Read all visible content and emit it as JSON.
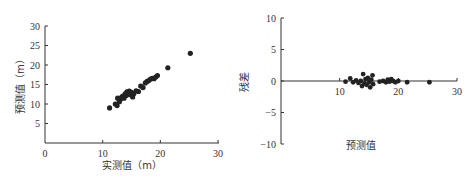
{
  "chart_data": [
    {
      "type": "scatter",
      "title": "",
      "xlabel": "实测值（m）",
      "ylabel": "预测值（m）",
      "xlim": [
        0,
        30
      ],
      "ylim": [
        0,
        30
      ],
      "xticks": [
        "0",
        "10",
        "20",
        "30"
      ],
      "yticks": [
        "5",
        "10",
        "15",
        "20",
        "25",
        "30"
      ],
      "grid": false,
      "legend": null,
      "color": "#222222",
      "points": [
        [
          11.2,
          9.0
        ],
        [
          12.2,
          10.0
        ],
        [
          12.5,
          9.6
        ],
        [
          12.6,
          11.5
        ],
        [
          12.9,
          10.6
        ],
        [
          13.1,
          11.2
        ],
        [
          13.3,
          11.8
        ],
        [
          13.5,
          12.0
        ],
        [
          13.7,
          11.5
        ],
        [
          13.9,
          12.6
        ],
        [
          14.1,
          12.2
        ],
        [
          14.2,
          13.1
        ],
        [
          14.4,
          12.7
        ],
        [
          14.6,
          13.3
        ],
        [
          14.8,
          12.4
        ],
        [
          15.0,
          13.0
        ],
        [
          15.2,
          11.8
        ],
        [
          15.4,
          12.6
        ],
        [
          15.8,
          13.4
        ],
        [
          16.2,
          13.2
        ],
        [
          16.6,
          14.6
        ],
        [
          17.0,
          14.2
        ],
        [
          17.4,
          15.4
        ],
        [
          17.7,
          15.8
        ],
        [
          18.0,
          16.0
        ],
        [
          18.3,
          16.4
        ],
        [
          18.6,
          16.6
        ],
        [
          18.9,
          16.5
        ],
        [
          19.2,
          16.9
        ],
        [
          19.5,
          17.3
        ],
        [
          21.3,
          19.3
        ],
        [
          25.2,
          23.0
        ]
      ]
    },
    {
      "type": "scatter",
      "title": "",
      "xlabel": "预测值",
      "ylabel": "残差",
      "xlim": [
        0,
        30
      ],
      "ylim": [
        -10,
        10
      ],
      "xticks": [
        "10",
        "20",
        "30"
      ],
      "yticks": [
        "10",
        "5",
        "0",
        "−5",
        "−10"
      ],
      "grid": false,
      "legend": null,
      "color": "#222222",
      "points": [
        [
          11.0,
          -0.1
        ],
        [
          11.8,
          0.4
        ],
        [
          12.3,
          -0.2
        ],
        [
          12.8,
          0.1
        ],
        [
          13.2,
          -0.3
        ],
        [
          13.6,
          0.0
        ],
        [
          13.8,
          -0.8
        ],
        [
          14.0,
          1.1
        ],
        [
          14.2,
          -0.4
        ],
        [
          14.4,
          0.3
        ],
        [
          14.6,
          -0.6
        ],
        [
          14.8,
          0.5
        ],
        [
          15.0,
          -0.2
        ],
        [
          15.2,
          -1.0
        ],
        [
          15.4,
          0.2
        ],
        [
          15.6,
          0.9
        ],
        [
          15.7,
          -0.5
        ],
        [
          16.8,
          -0.1
        ],
        [
          17.4,
          0.0
        ],
        [
          17.9,
          -0.2
        ],
        [
          18.2,
          0.2
        ],
        [
          18.5,
          -0.1
        ],
        [
          18.8,
          0.3
        ],
        [
          19.1,
          0.0
        ],
        [
          19.5,
          -0.2
        ],
        [
          20.0,
          0.0
        ],
        [
          21.5,
          -0.2
        ],
        [
          25.3,
          -0.2
        ]
      ]
    }
  ]
}
